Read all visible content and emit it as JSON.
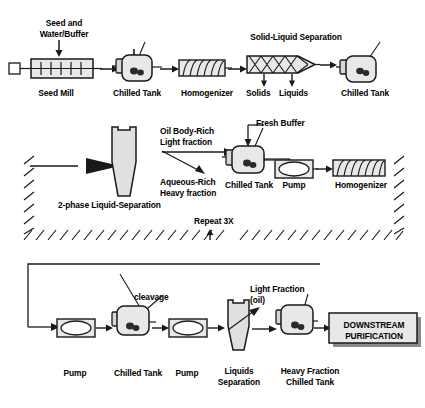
{
  "diagram": {
    "colors": {
      "stroke": "#1a1a1a",
      "fill_light": "#e8e8e8",
      "fill_mid": "#d6d6d6",
      "fill_dark": "#2a2a2a",
      "shadow": "#8a8a8a",
      "background": "#ffffff"
    }
  },
  "row1": {
    "feed_label": "Seed and\nWater/Buffer",
    "units": [
      {
        "name": "seed-mill",
        "label": "Seed Mill"
      },
      {
        "name": "chilled-tank-1",
        "label": "Chilled Tank"
      },
      {
        "name": "homogenizer-1",
        "label": "Homogenizer"
      },
      {
        "name": "solid-liquid-sep",
        "label": "Solid-Liquid Separation"
      },
      {
        "name": "chilled-tank-2",
        "label": "Chilled Tank"
      }
    ],
    "outlet_solids": "Solids",
    "outlet_liquids": "Liquids"
  },
  "row2": {
    "separator_label": "2-phase Liquid-Separation",
    "light_fraction": "Oil Body-Rich\nLight fraction",
    "heavy_fraction": "Aqueous-Rich\nHeavy fraction",
    "fresh_buffer": "Fresh Buffer",
    "units": [
      {
        "name": "chilled-tank-3",
        "label": "Chilled Tank"
      },
      {
        "name": "pump-1",
        "label": "Pump"
      },
      {
        "name": "homogenizer-2",
        "label": "Homogenizer"
      }
    ],
    "repeat_label": "Repeat 3X"
  },
  "row3": {
    "cleavage_label": "cleavage",
    "light_fraction_oil": "Light Fraction\n(oil)",
    "units": [
      {
        "name": "pump-2",
        "label": "Pump"
      },
      {
        "name": "chilled-tank-4",
        "label": "Chilled Tank"
      },
      {
        "name": "pump-3",
        "label": "Pump"
      },
      {
        "name": "liquids-separation",
        "label": "Liquids\nSeparation"
      },
      {
        "name": "heavy-fraction-chilled-tank",
        "label": "Heavy Fraction\nChilled Tank"
      }
    ],
    "downstream": "DOWNSTREAM\nPURIFICATION"
  }
}
